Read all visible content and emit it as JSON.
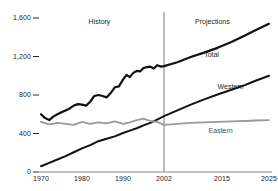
{
  "chart_data": {
    "type": "line",
    "title": "",
    "xlabel": "",
    "ylabel": "",
    "xlim": [
      1970,
      2025
    ],
    "ylim": [
      0,
      1600
    ],
    "grid": false,
    "legend_position": "inline-right",
    "y_ticks": [
      "0",
      "400",
      "800",
      "1,200",
      "1,600"
    ],
    "y_tick_values": [
      0,
      400,
      800,
      1200,
      1600
    ],
    "x_ticks": [
      "1970",
      "1980",
      "1990",
      "2002",
      "2015",
      "2025"
    ],
    "x_tick_values": [
      1970,
      1980,
      1990,
      2002,
      2015,
      2025
    ],
    "divider_year": 2002,
    "annotations": [
      {
        "text": "History",
        "x": 1986,
        "y": 1560
      },
      {
        "text": "Projections",
        "x": 2013,
        "y": 1560
      }
    ],
    "series": [
      {
        "name": "Total",
        "color": "#111111",
        "width": 2.2,
        "label_x": 2011,
        "label_y": 1215,
        "x": [
          1970,
          1971,
          1972,
          1973,
          1974,
          1975,
          1976,
          1977,
          1978,
          1979,
          1980,
          1981,
          1982,
          1983,
          1984,
          1985,
          1986,
          1987,
          1988,
          1989,
          1990,
          1991,
          1992,
          1993,
          1994,
          1995,
          1996,
          1997,
          1998,
          1999,
          2000,
          2001,
          2002,
          2005,
          2008,
          2011,
          2014,
          2017,
          2020,
          2022,
          2025
        ],
        "values": [
          600,
          560,
          540,
          575,
          600,
          620,
          640,
          660,
          690,
          705,
          700,
          690,
          730,
          790,
          800,
          790,
          775,
          820,
          880,
          890,
          960,
          1010,
          985,
          1030,
          1050,
          1045,
          1080,
          1090,
          1095,
          1075,
          1110,
          1095,
          1100,
          1140,
          1195,
          1240,
          1290,
          1350,
          1420,
          1470,
          1540
        ]
      },
      {
        "name": "Western",
        "color": "#111111",
        "width": 2.0,
        "label_x": 2014,
        "label_y": 880,
        "x": [
          1970,
          1972,
          1974,
          1976,
          1978,
          1980,
          1982,
          1984,
          1986,
          1988,
          1990,
          1992,
          1994,
          1996,
          1998,
          2000,
          2002,
          2005,
          2008,
          2011,
          2014,
          2017,
          2020,
          2022,
          2025
        ],
        "values": [
          60,
          95,
          130,
          165,
          205,
          245,
          280,
          320,
          345,
          370,
          405,
          430,
          455,
          485,
          510,
          545,
          580,
          640,
          700,
          755,
          805,
          855,
          905,
          945,
          1000
        ]
      },
      {
        "name": "Eastern",
        "color": "#9a9a9a",
        "width": 1.8,
        "label_x": 2012,
        "label_y": 430,
        "x": [
          1970,
          1972,
          1974,
          1976,
          1978,
          1980,
          1982,
          1984,
          1986,
          1988,
          1990,
          1992,
          1994,
          1996,
          1998,
          2000,
          2002,
          2005,
          2008,
          2011,
          2014,
          2017,
          2020,
          2022,
          2025
        ],
        "values": [
          520,
          495,
          510,
          500,
          490,
          520,
          500,
          515,
          505,
          525,
          500,
          515,
          540,
          555,
          530,
          520,
          490,
          500,
          510,
          515,
          520,
          525,
          530,
          535,
          540
        ]
      }
    ]
  }
}
